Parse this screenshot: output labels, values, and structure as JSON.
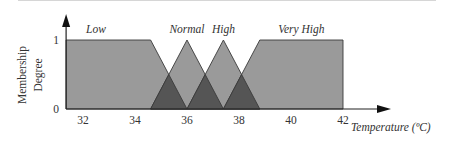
{
  "chart_data": {
    "type": "area",
    "title": "",
    "xlabel": "Temperature (ºC)",
    "ylabel": [
      "Membership",
      "Degree"
    ],
    "xlim": [
      31.35,
      42
    ],
    "ylim": [
      0,
      1
    ],
    "x_ticks": [
      32,
      34,
      36,
      38,
      40,
      42
    ],
    "x_tick_labels": [
      "32",
      "34",
      "36",
      "38",
      "40",
      "42"
    ],
    "y_ticks": [
      0,
      1
    ],
    "y_tick_labels": [
      "0",
      "1"
    ],
    "grid": false,
    "legend": "none",
    "series": [
      {
        "name": "Low",
        "shape": "trapezoid",
        "points": [
          [
            31.35,
            1
          ],
          [
            34.6,
            1
          ],
          [
            36.0,
            0
          ]
        ],
        "label_x": 32.5
      },
      {
        "name": "Normal",
        "shape": "triangle",
        "points": [
          [
            34.6,
            0
          ],
          [
            36.0,
            1
          ],
          [
            37.4,
            0
          ]
        ],
        "label_x": 36.0
      },
      {
        "name": "High",
        "shape": "triangle",
        "points": [
          [
            36.0,
            0
          ],
          [
            37.4,
            1
          ],
          [
            38.8,
            0
          ]
        ],
        "label_x": 37.4
      },
      {
        "name": "Very High",
        "shape": "trapezoid",
        "points": [
          [
            37.4,
            0
          ],
          [
            38.8,
            1
          ],
          [
            42.0,
            1
          ],
          [
            42.0,
            0
          ]
        ],
        "label_x": 40.4
      }
    ],
    "colors": {
      "fill": "#9a9a9a",
      "overlap": "#555555",
      "stroke": "#3a3a3a",
      "axis": "#222222"
    }
  }
}
